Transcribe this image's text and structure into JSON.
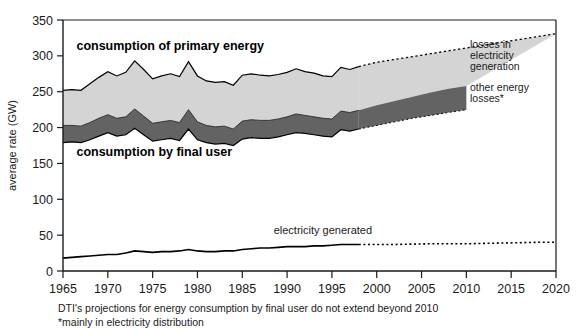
{
  "chart_data": {
    "type": "area",
    "title": "",
    "xlabel": "",
    "ylabel": "average rate (GW)",
    "xlim": [
      1965,
      2020
    ],
    "ylim": [
      0,
      350
    ],
    "grid": false,
    "legend_position": "inside-right",
    "x_ticks": [
      1965,
      1970,
      1975,
      1980,
      1985,
      1990,
      1995,
      2000,
      2005,
      2010,
      2015,
      2020
    ],
    "y_ticks": [
      0,
      50,
      100,
      150,
      200,
      250,
      300,
      350
    ],
    "projection_starts": 1998,
    "annotations": [
      {
        "text": "consumption of primary energy",
        "x": 1966.5,
        "y": 308,
        "style": "bold"
      },
      {
        "text": "consumption by final user",
        "x": 1966.5,
        "y": 160,
        "style": "bold"
      },
      {
        "text": "electricity generated",
        "x": 1988.5,
        "y": 52,
        "style": "regular"
      }
    ],
    "legend_entries": [
      {
        "label": "losses in electricity generation",
        "color": "#d4d4d4"
      },
      {
        "label": "other energy losses*",
        "color": "#636363"
      }
    ],
    "series": [
      {
        "name": "consumption of primary energy",
        "band_color": "#d4d4d4",
        "x": [
          1965,
          1966,
          1967,
          1968,
          1969,
          1970,
          1971,
          1972,
          1973,
          1974,
          1975,
          1976,
          1977,
          1978,
          1979,
          1980,
          1981,
          1982,
          1983,
          1984,
          1985,
          1986,
          1987,
          1988,
          1989,
          1990,
          1991,
          1992,
          1993,
          1994,
          1995,
          1996,
          1997,
          1998
        ],
        "values": [
          252,
          253,
          252,
          261,
          270,
          278,
          272,
          277,
          293,
          281,
          268,
          272,
          275,
          271,
          292,
          272,
          265,
          263,
          264,
          259,
          273,
          275,
          273,
          272,
          274,
          277,
          282,
          278,
          276,
          272,
          271,
          284,
          281,
          285
        ]
      },
      {
        "name": "consumption of primary energy (projection)",
        "x": [
          1998,
          2000,
          2002,
          2004,
          2006,
          2008,
          2010,
          2012,
          2014,
          2016,
          2018,
          2020
        ],
        "values": [
          285,
          291,
          295,
          299,
          303,
          307,
          311,
          315,
          319,
          323,
          327,
          331
        ]
      },
      {
        "name": "consumption by final user plus other energy losses",
        "band_color": "#636363",
        "x": [
          1965,
          1966,
          1967,
          1968,
          1969,
          1970,
          1971,
          1972,
          1973,
          1974,
          1975,
          1976,
          1977,
          1978,
          1979,
          1980,
          1981,
          1982,
          1983,
          1984,
          1985,
          1986,
          1987,
          1988,
          1989,
          1990,
          1991,
          1992,
          1993,
          1994,
          1995,
          1996,
          1997,
          1998
        ],
        "values": [
          203,
          203,
          202,
          207,
          213,
          218,
          213,
          215,
          226,
          216,
          206,
          208,
          210,
          207,
          225,
          208,
          203,
          201,
          202,
          198,
          209,
          211,
          210,
          210,
          212,
          215,
          219,
          217,
          215,
          213,
          212,
          223,
          221,
          224
        ]
      },
      {
        "name": "consumption by final user plus other energy losses (projection)",
        "x": [
          1998,
          2000,
          2002,
          2004,
          2006,
          2008,
          2010
        ],
        "values": [
          224,
          231,
          237,
          243,
          249,
          254,
          258
        ]
      },
      {
        "name": "consumption by final user",
        "x": [
          1965,
          1966,
          1967,
          1968,
          1969,
          1970,
          1971,
          1972,
          1973,
          1974,
          1975,
          1976,
          1977,
          1978,
          1979,
          1980,
          1981,
          1982,
          1983,
          1984,
          1985,
          1986,
          1987,
          1988,
          1989,
          1990,
          1991,
          1992,
          1993,
          1994,
          1995,
          1996,
          1997,
          1998
        ],
        "values": [
          179,
          180,
          179,
          183,
          188,
          193,
          188,
          190,
          199,
          190,
          181,
          183,
          185,
          182,
          198,
          183,
          179,
          177,
          178,
          175,
          184,
          186,
          185,
          185,
          187,
          190,
          193,
          192,
          190,
          188,
          187,
          197,
          195,
          198
        ]
      },
      {
        "name": "consumption by final user (projection)",
        "x": [
          1998,
          2000,
          2002,
          2004,
          2006,
          2008,
          2010
        ],
        "values": [
          198,
          203,
          208,
          213,
          217,
          221,
          225
        ]
      },
      {
        "name": "electricity generated",
        "line_color": "#000000",
        "x": [
          1965,
          1966,
          1967,
          1968,
          1969,
          1970,
          1971,
          1972,
          1973,
          1974,
          1975,
          1976,
          1977,
          1978,
          1979,
          1980,
          1981,
          1982,
          1983,
          1984,
          1985,
          1986,
          1987,
          1988,
          1989,
          1990,
          1991,
          1992,
          1993,
          1994,
          1995,
          1996,
          1997,
          1998
        ],
        "values": [
          18,
          19,
          20,
          21,
          22,
          23,
          23,
          25,
          28,
          27,
          26,
          27,
          27,
          28,
          30,
          28,
          27,
          27,
          28,
          28,
          30,
          31,
          32,
          32,
          33,
          34,
          34,
          34,
          35,
          35,
          36,
          37,
          37,
          37
        ]
      },
      {
        "name": "electricity generated (projection)",
        "x": [
          1998,
          2002,
          2006,
          2010,
          2014,
          2018,
          2020
        ],
        "values": [
          37,
          37,
          38,
          38,
          39,
          40,
          40
        ]
      }
    ]
  },
  "caption": {
    "line1": "DTI's projections for energy consumption by final user do not extend beyond 2010",
    "line2": "*mainly in electricity distribution"
  },
  "colors": {
    "light_band": "#d4d4d4",
    "dark_band": "#636363",
    "axis": "#1a1a1a",
    "line": "#000000",
    "background": "#ffffff"
  }
}
